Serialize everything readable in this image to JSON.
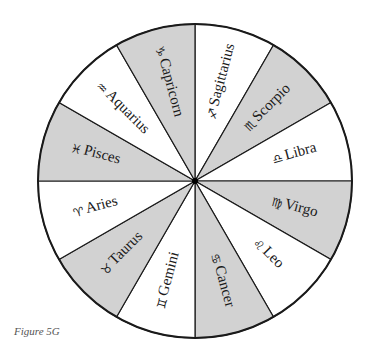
{
  "figure": {
    "caption": "Figure 5G",
    "colors": {
      "shaded": "#d2d2d2",
      "plain": "#ffffff",
      "line": "#1a1a1a"
    },
    "wheel": {
      "center": [
        195,
        181
      ],
      "radius": 157,
      "signs": [
        {
          "name": "Sagittarius",
          "symbol": "♐",
          "shaded": false,
          "mid_angle": 75,
          "rot": -75
        },
        {
          "name": "Scorpio",
          "symbol": "♏",
          "shaded": true,
          "mid_angle": 45,
          "rot": -45
        },
        {
          "name": "Libra",
          "symbol": "♎",
          "shaded": false,
          "mid_angle": 15,
          "rot": -15
        },
        {
          "name": "Virgo",
          "symbol": "♍",
          "shaded": true,
          "mid_angle": -15,
          "rot": 15
        },
        {
          "name": "Leo",
          "symbol": "♌",
          "shaded": false,
          "mid_angle": -45,
          "rot": 45
        },
        {
          "name": "Cancer",
          "symbol": "♋",
          "shaded": true,
          "mid_angle": -75,
          "rot": 75
        },
        {
          "name": "Gemini",
          "symbol": "♊",
          "shaded": false,
          "mid_angle": -105,
          "rot": -75
        },
        {
          "name": "Taurus",
          "symbol": "♉",
          "shaded": true,
          "mid_angle": -135,
          "rot": -45
        },
        {
          "name": "Aries",
          "symbol": "♈",
          "shaded": false,
          "mid_angle": -165,
          "rot": -15
        },
        {
          "name": "Pisces",
          "symbol": "♓",
          "shaded": true,
          "mid_angle": 165,
          "rot": 15
        },
        {
          "name": "Aquarius",
          "symbol": "♒",
          "shaded": false,
          "mid_angle": 135,
          "rot": 45
        },
        {
          "name": "Capricorn",
          "symbol": "♑",
          "shaded": true,
          "mid_angle": 105,
          "rot": 75
        }
      ]
    }
  }
}
